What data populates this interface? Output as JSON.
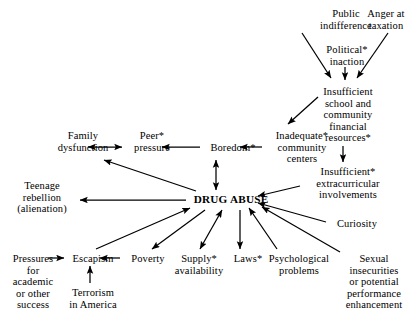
{
  "diagram": {
    "type": "concept-map",
    "background_color": "#ffffff",
    "line_color": "#000000",
    "nodes": [
      {
        "id": "public_indifference",
        "label": "Public\nindifference",
        "x": 310,
        "y": 8,
        "w": 72,
        "bold": false
      },
      {
        "id": "anger_taxation",
        "label": "Anger at\ntaxation",
        "x": 357,
        "y": 8,
        "w": 58,
        "bold": false
      },
      {
        "id": "political_inaction",
        "label": "Political*\ninaction",
        "x": 316,
        "y": 44,
        "w": 62,
        "bold": false
      },
      {
        "id": "insufficient_school",
        "label": "Insufficient\nschool and\ncommunity\nfinancial\nresources*",
        "x": 310,
        "y": 86,
        "w": 76,
        "bold": false
      },
      {
        "id": "inadequate_community",
        "label": "Inadequate*\ncommunity\ncenters",
        "x": 266,
        "y": 130,
        "w": 72,
        "bold": false
      },
      {
        "id": "boredom",
        "label": "Boredom*",
        "x": 204,
        "y": 142,
        "w": 58,
        "bold": false
      },
      {
        "id": "peer_pressure",
        "label": "Peer*\npressure",
        "x": 126,
        "y": 130,
        "w": 52,
        "bold": false
      },
      {
        "id": "family_dysfunction",
        "label": "Family\ndysfunction",
        "x": 47,
        "y": 130,
        "w": 72,
        "bold": false
      },
      {
        "id": "insufficient_extra",
        "label": "Insufficient*\nextracurricular\ninvolvements",
        "x": 304,
        "y": 166,
        "w": 88,
        "bold": false
      },
      {
        "id": "teenage_rebellion",
        "label": "Teenage\nrebellion\n(alienation)",
        "x": 8,
        "y": 180,
        "w": 68,
        "bold": false
      },
      {
        "id": "drug_abuse",
        "label": "DRUG ABUSE",
        "x": 188,
        "y": 194,
        "w": 86,
        "bold": true
      },
      {
        "id": "curiosity",
        "label": "Curiosity",
        "x": 330,
        "y": 218,
        "w": 54,
        "bold": false
      },
      {
        "id": "pressures_academic",
        "label": "Pressures\nfor\nacademic\nor other\nsuccess",
        "x": 4,
        "y": 253,
        "w": 58,
        "bold": false
      },
      {
        "id": "escapism",
        "label": "Escapism",
        "x": 66,
        "y": 253,
        "w": 54,
        "bold": false
      },
      {
        "id": "poverty",
        "label": "Poverty",
        "x": 124,
        "y": 253,
        "w": 48,
        "bold": false
      },
      {
        "id": "supply_availability",
        "label": "Supply*\navailability",
        "x": 168,
        "y": 253,
        "w": 62,
        "bold": false
      },
      {
        "id": "laws",
        "label": "Laws*",
        "x": 229,
        "y": 253,
        "w": 38,
        "bold": false
      },
      {
        "id": "psychological",
        "label": "Psychological\nproblems",
        "x": 260,
        "y": 253,
        "w": 78,
        "bold": false
      },
      {
        "id": "terrorism",
        "label": "Terrorism\nin America",
        "x": 61,
        "y": 287,
        "w": 64,
        "bold": false
      },
      {
        "id": "sexual_insecurities",
        "label": "Sexual\ninsecurities\nor potential\nperformance\nenhancement",
        "x": 337,
        "y": 253,
        "w": 74,
        "bold": false
      }
    ],
    "edges": [
      {
        "id": "e-public-school",
        "from": "public_indifference",
        "to": "insufficient_school",
        "x1": 302,
        "y1": 33,
        "x2": 331,
        "y2": 78,
        "heads": "end"
      },
      {
        "id": "e-anger-school",
        "from": "anger_taxation",
        "to": "insufficient_school",
        "x1": 388,
        "y1": 33,
        "x2": 357,
        "y2": 78,
        "heads": "end"
      },
      {
        "id": "e-political-school",
        "from": "political_inaction",
        "to": "insufficient_school",
        "x1": 345,
        "y1": 67,
        "x2": 345,
        "y2": 80,
        "heads": "end"
      },
      {
        "id": "e-school-inadequate",
        "from": "insufficient_school",
        "to": "inadequate_community",
        "x1": 318,
        "y1": 97,
        "x2": 288,
        "y2": 124,
        "heads": "end"
      },
      {
        "id": "e-school-extra",
        "from": "insufficient_school",
        "to": "insufficient_extra",
        "x1": 343,
        "y1": 146,
        "x2": 343,
        "y2": 162,
        "heads": "end"
      },
      {
        "id": "e-inadequate-boredom",
        "from": "inadequate_community",
        "to": "boredom",
        "x1": 262,
        "y1": 147,
        "x2": 240,
        "y2": 147,
        "heads": "end"
      },
      {
        "id": "e-boredom-peer",
        "from": "boredom",
        "to": "peer_pressure",
        "x1": 200,
        "y1": 147,
        "x2": 162,
        "y2": 147,
        "heads": "end"
      },
      {
        "id": "e-peer-family",
        "from": "peer_pressure",
        "to": "family_dysfunction",
        "x1": 122,
        "y1": 147,
        "x2": 88,
        "y2": 147,
        "heads": "both"
      },
      {
        "id": "e-boredom-drug",
        "from": "boredom",
        "to": "drug_abuse",
        "x1": 216,
        "y1": 160,
        "x2": 216,
        "y2": 190,
        "heads": "both"
      },
      {
        "id": "e-extra-drug",
        "from": "insufficient_extra",
        "to": "drug_abuse",
        "x1": 300,
        "y1": 186,
        "x2": 258,
        "y2": 196,
        "heads": "end"
      },
      {
        "id": "e-curiosity-drug",
        "from": "curiosity",
        "to": "drug_abuse",
        "x1": 326,
        "y1": 222,
        "x2": 258,
        "y2": 203,
        "heads": "end"
      },
      {
        "id": "e-sexual-drug",
        "from": "sexual_insecurities",
        "to": "drug_abuse",
        "x1": 340,
        "y1": 252,
        "x2": 262,
        "y2": 207,
        "heads": "end"
      },
      {
        "id": "e-psych-drug",
        "from": "psychological",
        "to": "drug_abuse",
        "x1": 277,
        "y1": 249,
        "x2": 249,
        "y2": 208,
        "heads": "end"
      },
      {
        "id": "e-drug-laws",
        "from": "drug_abuse",
        "to": "laws",
        "x1": 240,
        "y1": 210,
        "x2": 240,
        "y2": 249,
        "heads": "end"
      },
      {
        "id": "e-drug-supply",
        "from": "drug_abuse",
        "to": "supply_availability",
        "x1": 222,
        "y1": 210,
        "x2": 200,
        "y2": 249,
        "heads": "both"
      },
      {
        "id": "e-drug-poverty",
        "from": "drug_abuse",
        "to": "poverty",
        "x1": 205,
        "y1": 210,
        "x2": 152,
        "y2": 249,
        "heads": "end"
      },
      {
        "id": "e-escapism-drug",
        "from": "escapism",
        "to": "drug_abuse",
        "x1": 96,
        "y1": 249,
        "x2": 190,
        "y2": 208,
        "heads": "end"
      },
      {
        "id": "e-drug-teenage",
        "from": "drug_abuse",
        "to": "teenage_rebellion",
        "x1": 186,
        "y1": 200,
        "x2": 80,
        "y2": 200,
        "heads": "end"
      },
      {
        "id": "e-drug-family",
        "from": "drug_abuse",
        "to": "family_dysfunction",
        "x1": 196,
        "y1": 191,
        "x2": 104,
        "y2": 160,
        "heads": "end"
      },
      {
        "id": "e-poverty-escapism",
        "from": "poverty",
        "to": "escapism",
        "x1": 120,
        "y1": 258,
        "x2": 100,
        "y2": 258,
        "heads": "end"
      },
      {
        "id": "e-pressures-escapism",
        "from": "pressures_academic",
        "to": "escapism",
        "x1": 48,
        "y1": 258,
        "x2": 64,
        "y2": 258,
        "heads": "end"
      },
      {
        "id": "e-terrorism-escapism",
        "from": "terrorism",
        "to": "escapism",
        "x1": 90,
        "y1": 283,
        "x2": 90,
        "y2": 266,
        "heads": "end"
      }
    ]
  }
}
